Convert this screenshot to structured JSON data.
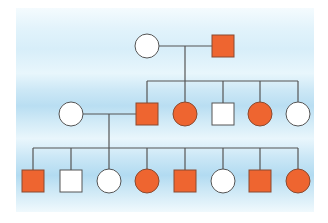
{
  "diagram": {
    "type": "pedigree-chart",
    "colors": {
      "affected_fill": "#EE6530",
      "affected_stroke": "#8A4A30",
      "unaffected_fill": "#FFFFFF",
      "unaffected_stroke": "#555555",
      "line": "#555555"
    },
    "legend_note": "squares = male, circles = female, orange = affected, white = unaffected",
    "generations": [
      {
        "label": "I",
        "individuals": [
          {
            "id": "I-1",
            "sex": "female",
            "affected": false,
            "cx": 147,
            "cy": 46
          },
          {
            "id": "I-2",
            "sex": "male",
            "affected": true,
            "cx": 223,
            "cy": 46
          }
        ]
      },
      {
        "label": "II",
        "individuals": [
          {
            "id": "II-spouse",
            "sex": "female",
            "affected": false,
            "cx": 71,
            "cy": 114
          },
          {
            "id": "II-1",
            "sex": "male",
            "affected": true,
            "cx": 147,
            "cy": 114
          },
          {
            "id": "II-2",
            "sex": "female",
            "affected": true,
            "cx": 185,
            "cy": 114
          },
          {
            "id": "II-3",
            "sex": "male",
            "affected": false,
            "cx": 223,
            "cy": 114
          },
          {
            "id": "II-4",
            "sex": "female",
            "affected": true,
            "cx": 260,
            "cy": 114
          },
          {
            "id": "II-5",
            "sex": "female",
            "affected": false,
            "cx": 298,
            "cy": 114
          }
        ]
      },
      {
        "label": "III",
        "individuals": [
          {
            "id": "III-1",
            "sex": "male",
            "affected": true,
            "cx": 33,
            "cy": 181
          },
          {
            "id": "III-2",
            "sex": "male",
            "affected": false,
            "cx": 71,
            "cy": 181
          },
          {
            "id": "III-3",
            "sex": "female",
            "affected": false,
            "cx": 109,
            "cy": 181
          },
          {
            "id": "III-4",
            "sex": "female",
            "affected": true,
            "cx": 147,
            "cy": 181
          },
          {
            "id": "III-5",
            "sex": "male",
            "affected": true,
            "cx": 185,
            "cy": 181
          },
          {
            "id": "III-6",
            "sex": "female",
            "affected": false,
            "cx": 223,
            "cy": 181
          },
          {
            "id": "III-7",
            "sex": "male",
            "affected": true,
            "cx": 260,
            "cy": 181
          },
          {
            "id": "III-8",
            "sex": "female",
            "affected": true,
            "cx": 298,
            "cy": 181
          }
        ]
      }
    ],
    "lines": [
      {
        "name": "marriage-line-gen1",
        "x1": 159,
        "y1": 46,
        "x2": 212,
        "y2": 46
      },
      {
        "name": "descent-line-gen1",
        "x1": 185,
        "y1": 46,
        "x2": 185,
        "y2": 81
      },
      {
        "name": "sibship-line-gen2",
        "x1": 147,
        "y1": 81,
        "x2": 298,
        "y2": 81
      },
      {
        "name": "drop-II-1",
        "x1": 147,
        "y1": 81,
        "x2": 147,
        "y2": 103
      },
      {
        "name": "drop-II-2",
        "x1": 185,
        "y1": 81,
        "x2": 185,
        "y2": 102
      },
      {
        "name": "drop-II-3",
        "x1": 223,
        "y1": 81,
        "x2": 223,
        "y2": 103
      },
      {
        "name": "drop-II-4",
        "x1": 260,
        "y1": 81,
        "x2": 260,
        "y2": 102
      },
      {
        "name": "drop-II-5",
        "x1": 298,
        "y1": 81,
        "x2": 298,
        "y2": 102
      },
      {
        "name": "marriage-line-gen2",
        "x1": 83,
        "y1": 114,
        "x2": 136,
        "y2": 114
      },
      {
        "name": "descent-line-gen2",
        "x1": 109,
        "y1": 114,
        "x2": 109,
        "y2": 148
      },
      {
        "name": "sibship-line-gen3",
        "x1": 33,
        "y1": 148,
        "x2": 298,
        "y2": 148
      },
      {
        "name": "drop-III-1",
        "x1": 33,
        "y1": 148,
        "x2": 33,
        "y2": 170
      },
      {
        "name": "drop-III-2",
        "x1": 71,
        "y1": 148,
        "x2": 71,
        "y2": 170
      },
      {
        "name": "drop-III-3",
        "x1": 109,
        "y1": 148,
        "x2": 109,
        "y2": 169
      },
      {
        "name": "drop-III-4",
        "x1": 147,
        "y1": 148,
        "x2": 147,
        "y2": 169
      },
      {
        "name": "drop-III-5",
        "x1": 185,
        "y1": 148,
        "x2": 185,
        "y2": 170
      },
      {
        "name": "drop-III-6",
        "x1": 223,
        "y1": 148,
        "x2": 223,
        "y2": 169
      },
      {
        "name": "drop-III-7",
        "x1": 260,
        "y1": 148,
        "x2": 260,
        "y2": 170
      },
      {
        "name": "drop-III-8",
        "x1": 298,
        "y1": 148,
        "x2": 298,
        "y2": 169
      }
    ],
    "shape_size": {
      "square_side": 22,
      "circle_radius": 12
    }
  }
}
